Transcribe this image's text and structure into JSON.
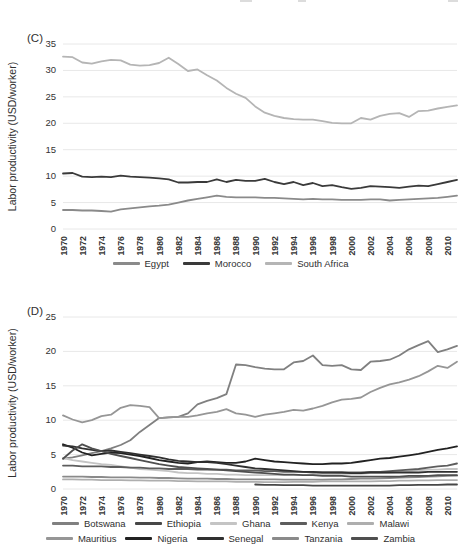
{
  "figure": {
    "panel_c_label": "(C)",
    "panel_d_label": "(D)",
    "background_color": "#ffffff",
    "gridline_color": "#e8e8e8",
    "axis_text_color": "#333333"
  },
  "chart_data": [
    {
      "id": "C",
      "type": "line",
      "panel_label": "(C)",
      "title": "",
      "xlabel": "",
      "ylabel": "Labor productivity (USD/worker)",
      "ylim": [
        0,
        35
      ],
      "yticks": [
        0,
        5,
        10,
        15,
        20,
        25,
        30,
        35
      ],
      "x_start": 1970,
      "x_end": 2011,
      "x_tick_labels": [
        "1970",
        "1972",
        "1974",
        "1976",
        "1978",
        "1980",
        "1982",
        "1984",
        "1986",
        "1988",
        "1990",
        "1992",
        "1994",
        "1996",
        "1998",
        "2000",
        "2002",
        "2004",
        "2006",
        "2008",
        "2010"
      ],
      "grid": "horizontal",
      "legend_position": "bottom",
      "series": [
        {
          "name": "Egypt",
          "color": "#8a8a8a",
          "values": [
            3.6,
            3.6,
            3.5,
            3.5,
            3.4,
            3.3,
            3.7,
            3.9,
            4.1,
            4.3,
            4.4,
            4.6,
            5.0,
            5.4,
            5.7,
            6.0,
            6.3,
            6.1,
            6.0,
            6.0,
            6.0,
            5.9,
            5.9,
            5.8,
            5.7,
            5.6,
            5.7,
            5.6,
            5.6,
            5.5,
            5.5,
            5.5,
            5.6,
            5.6,
            5.4,
            5.5,
            5.6,
            5.7,
            5.8,
            5.9,
            6.1,
            6.3
          ]
        },
        {
          "name": "Morocco",
          "color": "#3a3a3a",
          "values": [
            10.5,
            10.6,
            9.9,
            9.8,
            9.9,
            9.8,
            10.1,
            9.9,
            9.8,
            9.7,
            9.6,
            9.4,
            8.8,
            8.8,
            8.9,
            8.9,
            9.4,
            8.9,
            9.3,
            9.1,
            9.1,
            9.5,
            8.9,
            8.5,
            8.9,
            8.3,
            8.7,
            8.1,
            8.3,
            7.9,
            7.6,
            7.8,
            8.1,
            8.0,
            7.9,
            7.8,
            8.0,
            8.2,
            8.1,
            8.5,
            8.9,
            9.3
          ]
        },
        {
          "name": "South Africa",
          "color": "#b5b5b5",
          "values": [
            32.6,
            32.5,
            31.5,
            31.3,
            31.7,
            32.0,
            31.9,
            31.1,
            30.9,
            31.0,
            31.4,
            32.4,
            31.2,
            29.9,
            30.2,
            29.1,
            28.1,
            26.7,
            25.6,
            24.8,
            23.2,
            22.0,
            21.4,
            21.0,
            20.8,
            20.7,
            20.7,
            20.4,
            20.1,
            20.0,
            20.0,
            21.0,
            20.7,
            21.4,
            21.8,
            21.9,
            21.2,
            22.3,
            22.4,
            22.8,
            23.1,
            23.4
          ]
        }
      ]
    },
    {
      "id": "D",
      "type": "line",
      "panel_label": "(D)",
      "title": "",
      "xlabel": "",
      "ylabel": "Labor productivity (USD/worker)",
      "ylim": [
        0,
        25
      ],
      "yticks": [
        0,
        5,
        10,
        15,
        20,
        25
      ],
      "x_start": 1970,
      "x_end": 2011,
      "x_tick_labels": [
        "1970",
        "1972",
        "1974",
        "1976",
        "1978",
        "1980",
        "1982",
        "1984",
        "1986",
        "1988",
        "1990",
        "1992",
        "1994",
        "1996",
        "1998",
        "2000",
        "2002",
        "2004",
        "2006",
        "2008",
        "2010"
      ],
      "grid": "horizontal",
      "legend_position": "bottom",
      "series": [
        {
          "name": "Botswana",
          "color": "#808080",
          "values": [
            4.4,
            4.6,
            4.9,
            5.2,
            5.5,
            5.9,
            6.4,
            7.1,
            8.3,
            9.3,
            10.3,
            10.4,
            10.5,
            11.0,
            12.3,
            12.8,
            13.2,
            13.8,
            18.1,
            18.0,
            17.7,
            17.5,
            17.4,
            17.4,
            18.4,
            18.6,
            19.4,
            18.0,
            17.9,
            18.0,
            17.4,
            17.3,
            18.5,
            18.6,
            18.8,
            19.4,
            20.3,
            20.9,
            21.5,
            19.9,
            20.3,
            20.8
          ]
        },
        {
          "name": "Ethiopia",
          "color": "#474747",
          "values": [
            null,
            null,
            null,
            null,
            null,
            null,
            null,
            null,
            null,
            null,
            null,
            null,
            null,
            null,
            null,
            null,
            null,
            null,
            null,
            null,
            0.65,
            0.6,
            0.6,
            0.55,
            0.55,
            0.55,
            0.5,
            0.5,
            0.5,
            0.5,
            0.5,
            0.5,
            0.5,
            0.5,
            0.5,
            0.55,
            0.55,
            0.6,
            0.6,
            0.6,
            0.65,
            0.65
          ]
        },
        {
          "name": "Ghana",
          "color": "#c4c4c4",
          "values": [
            4.5,
            4.2,
            4.0,
            3.8,
            3.6,
            3.5,
            3.3,
            3.1,
            2.9,
            2.8,
            2.7,
            2.6,
            2.4,
            2.3,
            2.3,
            2.2,
            2.2,
            2.1,
            2.1,
            2.0,
            2.0,
            2.0,
            2.0,
            2.0,
            2.0,
            2.0,
            2.1,
            2.1,
            2.1,
            2.2,
            2.2,
            2.2,
            2.3,
            2.3,
            2.4,
            2.5,
            2.6,
            2.7,
            2.8,
            2.8,
            2.9,
            2.9
          ]
        },
        {
          "name": "Kenya",
          "color": "#5d5d5d",
          "values": [
            3.4,
            3.4,
            3.3,
            3.3,
            3.3,
            3.2,
            3.2,
            3.1,
            3.1,
            3.0,
            3.0,
            2.9,
            2.9,
            2.9,
            2.8,
            2.8,
            2.8,
            2.8,
            2.7,
            2.7,
            2.7,
            2.6,
            2.6,
            2.5,
            2.5,
            2.5,
            2.4,
            2.4,
            2.4,
            2.4,
            2.4,
            2.4,
            2.5,
            2.5,
            2.6,
            2.7,
            2.8,
            2.9,
            3.1,
            3.3,
            3.4,
            3.7
          ]
        },
        {
          "name": "Malawi",
          "color": "#aeaeae",
          "values": [
            1.4,
            1.4,
            1.35,
            1.35,
            1.3,
            1.3,
            1.3,
            1.25,
            1.25,
            1.2,
            1.2,
            1.2,
            1.15,
            1.15,
            1.1,
            1.1,
            1.1,
            1.1,
            1.05,
            1.05,
            1.05,
            1.0,
            1.0,
            1.0,
            1.05,
            1.05,
            1.05,
            1.1,
            1.1,
            1.1,
            1.1,
            1.1,
            1.1,
            1.15,
            1.15,
            1.2,
            1.2,
            1.25,
            1.25,
            1.3,
            1.3,
            1.3
          ]
        },
        {
          "name": "Mauritius",
          "color": "#969696",
          "values": [
            10.7,
            10.1,
            9.7,
            10.0,
            10.6,
            10.8,
            11.8,
            12.2,
            12.1,
            11.9,
            10.3,
            10.4,
            10.5,
            10.5,
            10.7,
            11.0,
            11.2,
            11.6,
            11.0,
            10.8,
            10.5,
            10.8,
            11.0,
            11.2,
            11.5,
            11.4,
            11.7,
            12.1,
            12.6,
            13.0,
            13.1,
            13.3,
            14.1,
            14.7,
            15.2,
            15.5,
            15.9,
            16.4,
            17.1,
            17.9,
            17.6,
            18.5
          ]
        },
        {
          "name": "Nigeria",
          "color": "#222222",
          "values": [
            6.5,
            6.0,
            5.3,
            4.9,
            5.1,
            5.3,
            5.2,
            5.0,
            4.8,
            4.5,
            4.2,
            4.0,
            3.8,
            3.7,
            3.9,
            4.0,
            3.9,
            3.8,
            3.8,
            4.0,
            4.4,
            4.2,
            4.0,
            3.9,
            3.8,
            3.7,
            3.6,
            3.6,
            3.7,
            3.7,
            3.8,
            4.0,
            4.2,
            4.4,
            4.5,
            4.7,
            4.9,
            5.1,
            5.4,
            5.7,
            5.9,
            6.2
          ]
        },
        {
          "name": "Senegal",
          "color": "#303030",
          "values": [
            6.3,
            6.2,
            5.9,
            5.7,
            5.5,
            5.6,
            5.4,
            5.2,
            5.0,
            4.8,
            4.6,
            4.3,
            4.1,
            4.0,
            3.9,
            3.9,
            3.8,
            3.6,
            3.4,
            3.2,
            3.0,
            2.9,
            2.8,
            2.7,
            2.6,
            2.5,
            2.5,
            2.4,
            2.4,
            2.4,
            2.3,
            2.3,
            2.4,
            2.4,
            2.4,
            2.4,
            2.4,
            2.4,
            2.5,
            2.5,
            2.5,
            2.5
          ]
        },
        {
          "name": "Tanzania",
          "color": "#8a8a8a",
          "values": [
            1.8,
            1.8,
            1.8,
            1.75,
            1.75,
            1.7,
            1.7,
            1.7,
            1.65,
            1.65,
            1.6,
            1.6,
            1.55,
            1.5,
            1.5,
            1.5,
            1.45,
            1.45,
            1.4,
            1.4,
            1.4,
            1.4,
            1.4,
            1.35,
            1.35,
            1.35,
            1.35,
            1.35,
            1.4,
            1.4,
            1.45,
            1.5,
            1.5,
            1.55,
            1.6,
            1.65,
            1.7,
            1.75,
            1.8,
            1.85,
            1.9,
            1.95
          ]
        },
        {
          "name": "Zambia",
          "color": "#4f4f4f",
          "values": [
            4.4,
            5.6,
            6.5,
            5.9,
            5.5,
            5.1,
            4.8,
            4.5,
            4.2,
            3.9,
            3.6,
            3.4,
            3.2,
            3.1,
            3.0,
            2.9,
            2.8,
            2.7,
            2.6,
            2.5,
            2.4,
            2.3,
            2.2,
            2.1,
            2.1,
            2.0,
            2.0,
            1.9,
            1.9,
            1.9,
            1.8,
            1.8,
            1.8,
            1.8,
            1.8,
            1.8,
            1.9,
            1.9,
            1.9,
            2.0,
            2.0,
            2.0
          ]
        }
      ]
    }
  ]
}
